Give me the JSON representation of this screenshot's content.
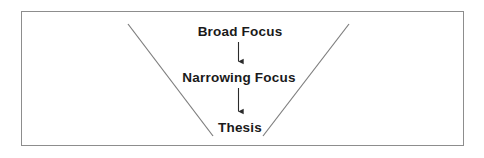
{
  "diagram": {
    "type": "funnel-flow",
    "background_color": "#ffffff",
    "frame": {
      "border_color": "#8d8d8d",
      "fill_color": "#ffffff"
    },
    "funnel": {
      "line_color": "#7d7d7d",
      "left_line": {
        "x1": 128,
        "y1": 24,
        "x2": 213,
        "y2": 136
      },
      "right_line": {
        "x1": 349,
        "y1": 24,
        "x2": 263,
        "y2": 136
      }
    },
    "nodes": [
      {
        "id": "broad-focus",
        "label": "Broad Focus",
        "text_color": "#1a1a1a"
      },
      {
        "id": "narrowing-focus",
        "label": "Narrowing Focus",
        "text_color": "#1a1a1a"
      },
      {
        "id": "thesis",
        "label": "Thesis",
        "text_color": "#1a1a1a"
      }
    ],
    "arrows": [
      {
        "id": "arrow-broad-to-narrowing",
        "from": "broad-focus",
        "to": "narrowing-focus",
        "direction": "down",
        "color": "#2b2b2b",
        "x": 238,
        "y1": 42,
        "y2": 67
      },
      {
        "id": "arrow-narrowing-to-thesis",
        "from": "narrowing-focus",
        "to": "thesis",
        "direction": "down",
        "color": "#2b2b2b",
        "x": 238,
        "y1": 88,
        "y2": 117
      }
    ]
  }
}
